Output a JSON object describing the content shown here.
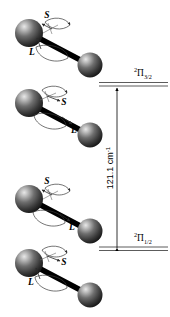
{
  "figure": {
    "background_color": "#ffffff",
    "ink_color": "#000000",
    "sphere_color": "#3b3b3b",
    "sphere_highlight": "#d8d8d8"
  },
  "molecules": [
    {
      "id": "molecule-1",
      "state": "2Pi-3/2",
      "spin_label": "S",
      "orbital_label": "L",
      "spin_direction": "up-left",
      "orbital_direction": "up-left",
      "atoms": 2
    },
    {
      "id": "molecule-2",
      "state": "2Pi-3/2",
      "spin_label": "S",
      "orbital_label": "L",
      "spin_direction": "down-right",
      "orbital_direction": "down-right",
      "atoms": 2
    },
    {
      "id": "molecule-3",
      "state": "2Pi-1/2",
      "spin_label": "S",
      "orbital_label": "L",
      "spin_direction": "up-left",
      "orbital_direction": "down-right",
      "atoms": 2
    },
    {
      "id": "molecule-4",
      "state": "2Pi-1/2",
      "spin_label": "S",
      "orbital_label": "L",
      "spin_direction": "down-right",
      "orbital_direction": "up-left",
      "atoms": 2
    }
  ],
  "energy_diagram": {
    "upper_level": {
      "name": "upper-energy-level",
      "term_multiplicity": "2",
      "term_symbol": "Π",
      "term_subscript": "3/2",
      "sublevels": 2
    },
    "lower_level": {
      "name": "lower-energy-level",
      "term_multiplicity": "2",
      "term_symbol": "Π",
      "term_subscript": "1/2",
      "sublevels": 2
    },
    "splitting": {
      "value": "121.1",
      "unit": "cm",
      "unit_exponent": "-1",
      "full_text": "121.1 cm",
      "orientation": "vertical"
    }
  },
  "vector_labels": {
    "spin": "S",
    "orbital": "L"
  }
}
